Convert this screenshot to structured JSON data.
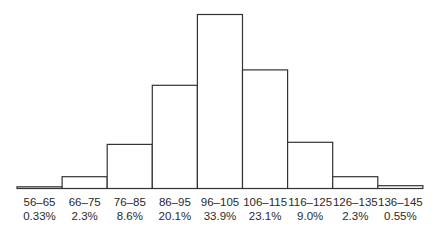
{
  "chart_data": {
    "type": "bar",
    "title": "",
    "xlabel": "",
    "ylabel": "",
    "categories": [
      "56–65",
      "66–75",
      "76–85",
      "86–95",
      "96–105",
      "106–115",
      "116–125",
      "126–135",
      "136–145"
    ],
    "values": [
      0.33,
      2.3,
      8.6,
      20.1,
      33.9,
      23.1,
      9.0,
      2.3,
      0.55
    ],
    "value_labels": [
      "0.33%",
      "2.3%",
      "8.6%",
      "20.1%",
      "33.9%",
      "23.1%",
      "9.0%",
      "2.3%",
      "0.55%"
    ],
    "unit": "%",
    "ylim": [
      0,
      33.9
    ],
    "grid": false,
    "legend": "none",
    "bar_fill": "#ffffff",
    "bar_stroke": "#333333"
  }
}
